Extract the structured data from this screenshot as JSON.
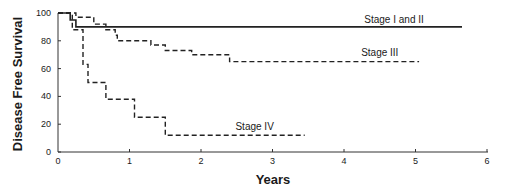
{
  "chart_data": {
    "type": "line",
    "subtype": "kaplan-meier step",
    "title": "",
    "xlabel": "Years",
    "ylabel": "Disease Free Survival",
    "xlim": [
      0,
      6
    ],
    "ylim": [
      0,
      100
    ],
    "xticks": [
      "0",
      "1",
      "2",
      "3",
      "4",
      "5",
      "6"
    ],
    "yticks": [
      "0",
      "20",
      "40",
      "60",
      "80",
      "100"
    ],
    "grid": false,
    "legend": "inline labels",
    "series": [
      {
        "name": "Stage I and II",
        "style": "solid",
        "points": [
          [
            0,
            100
          ],
          [
            0.17,
            100
          ],
          [
            0.17,
            95
          ],
          [
            0.25,
            95
          ],
          [
            0.25,
            90
          ],
          [
            5.65,
            90
          ]
        ]
      },
      {
        "name": "Stage III",
        "style": "dashed",
        "points": [
          [
            0,
            100
          ],
          [
            0.25,
            100
          ],
          [
            0.25,
            97
          ],
          [
            0.5,
            97
          ],
          [
            0.5,
            92
          ],
          [
            0.67,
            92
          ],
          [
            0.67,
            88
          ],
          [
            0.8,
            88
          ],
          [
            0.8,
            84
          ],
          [
            0.83,
            84
          ],
          [
            0.83,
            80
          ],
          [
            1.3,
            80
          ],
          [
            1.3,
            77
          ],
          [
            1.5,
            77
          ],
          [
            1.5,
            73
          ],
          [
            1.87,
            73
          ],
          [
            1.87,
            70
          ],
          [
            2.4,
            70
          ],
          [
            2.4,
            65
          ],
          [
            5.05,
            65
          ]
        ]
      },
      {
        "name": "Stage IV",
        "style": "dashed",
        "points": [
          [
            0,
            100
          ],
          [
            0.2,
            100
          ],
          [
            0.2,
            88
          ],
          [
            0.35,
            88
          ],
          [
            0.35,
            63
          ],
          [
            0.42,
            63
          ],
          [
            0.42,
            50
          ],
          [
            0.67,
            50
          ],
          [
            0.67,
            38
          ],
          [
            1.07,
            38
          ],
          [
            1.07,
            25
          ],
          [
            1.5,
            25
          ],
          [
            1.5,
            12
          ],
          [
            3.45,
            12
          ]
        ]
      }
    ],
    "annotations": [
      {
        "text": "Stage I and II",
        "x": 4.7,
        "y": 93
      },
      {
        "text": "Stage III",
        "x": 4.5,
        "y": 69
      },
      {
        "text": "Stage IV",
        "x": 2.75,
        "y": 16
      }
    ]
  }
}
